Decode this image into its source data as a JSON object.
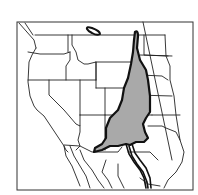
{
  "map": {
    "title": "",
    "region": "Western United States and northern Mexico",
    "colors": {
      "background": "#ffffff",
      "state_borders": "#222222",
      "range_fill": "#a9a9a9",
      "range_outline": "#111111"
    },
    "layers": [
      {
        "name": "frame",
        "label": "Map frame"
      },
      {
        "name": "state-borders",
        "label": "State and national borders"
      },
      {
        "name": "shaded-range",
        "label": "Shaded distribution range"
      },
      {
        "name": "southern-corridor",
        "label": "Narrow southern extension"
      }
    ]
  }
}
